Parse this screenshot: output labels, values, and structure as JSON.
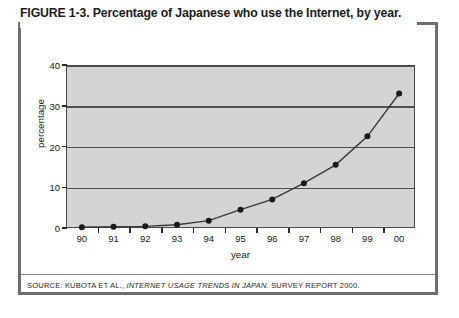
{
  "title": "FIGURE 1-3. Percentage of Japanese who use the Internet, by year.",
  "source": {
    "prefix": "SOURCE: KUBOTA ET AL., ",
    "italic": "INTERNET USAGE TRENDS IN JAPAN.",
    "suffix": " SURVEY REPORT 2000."
  },
  "colors": {
    "plot_background": "#d4d4d4",
    "frame_border": "#6e6e6e",
    "gridline": "#4f4f4f",
    "series_line": "#3a3a3a",
    "marker": "#1a1a1a",
    "text": "#1b1b1b"
  },
  "chart_data": {
    "type": "line",
    "title": "FIGURE 1-3. Percentage of Japanese who use the Internet, by year.",
    "xlabel": "year",
    "ylabel": "percentage",
    "categories": [
      "90",
      "91",
      "92",
      "93",
      "94",
      "95",
      "96",
      "97",
      "98",
      "99",
      "00"
    ],
    "values": [
      0.2,
      0.3,
      0.4,
      0.8,
      1.8,
      4.5,
      7.0,
      11.0,
      15.5,
      22.5,
      33.0
    ],
    "ylim": [
      0,
      40
    ],
    "yticks": [
      0,
      10,
      20,
      30,
      40
    ],
    "ytick_labels": [
      "0",
      "10",
      "20",
      "30",
      "40"
    ],
    "grid": true,
    "legend": false,
    "marker": "filled-circle"
  }
}
